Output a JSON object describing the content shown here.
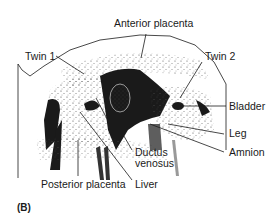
{
  "figure": {
    "panel_label": "(B)",
    "labels": {
      "anterior_placenta": "Anterior placenta",
      "twin1": "Twin 1",
      "twin2": "Twin 2",
      "bladder": "Bladder",
      "leg": "Leg",
      "amnion": "Amnion",
      "ductus_venosus_line1": "Ductus",
      "ductus_venosus_line2": "venosus",
      "posterior_placenta": "Posterior placenta",
      "liver": "Liver"
    },
    "colors": {
      "ink": "#1a1a1a",
      "background": "#ffffff"
    }
  }
}
